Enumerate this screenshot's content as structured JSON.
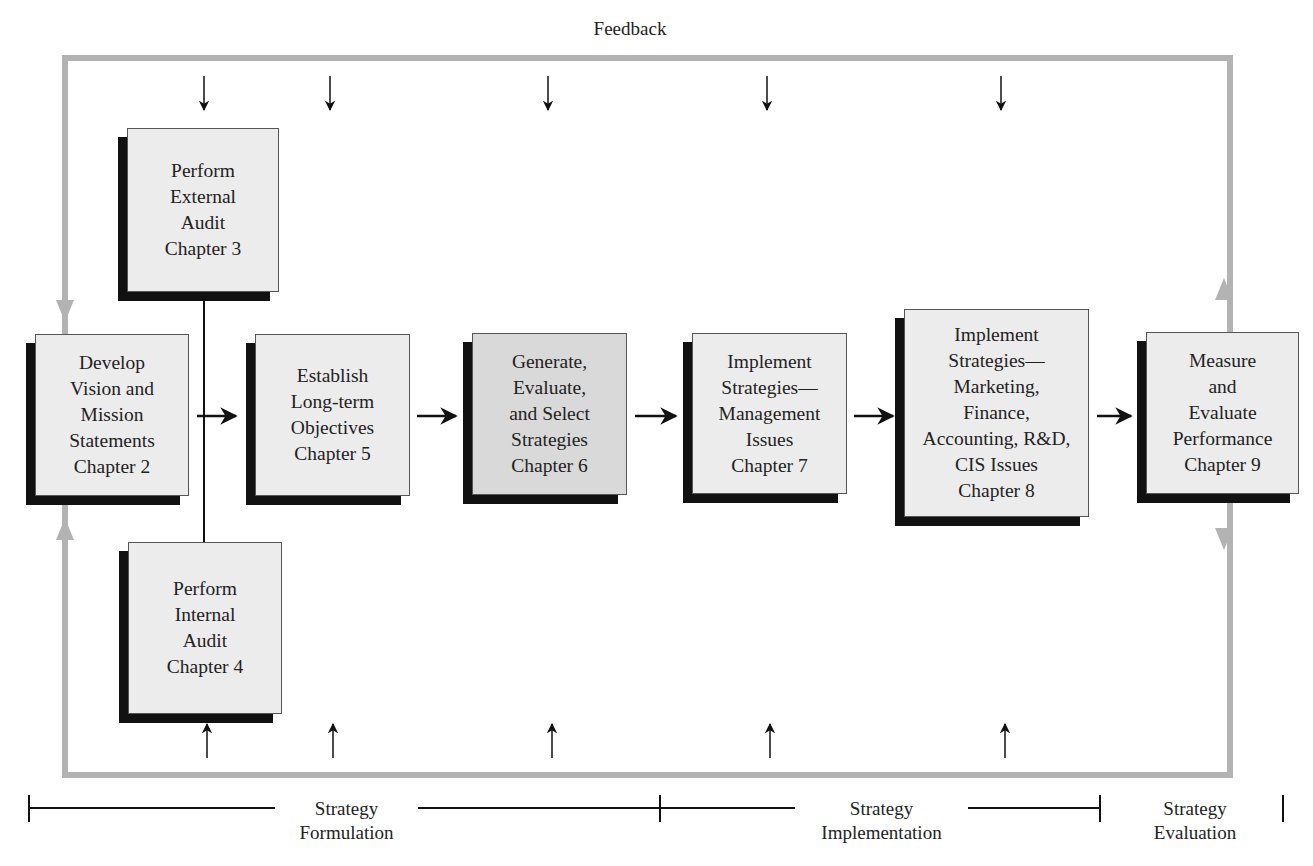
{
  "diagram": {
    "feedback_label": "Feedback",
    "colors": {
      "box_fill": "#ececec",
      "box_fill_highlight": "#d9d9d9",
      "shadow": "#111111",
      "feedback_loop": "#b3b3b3",
      "arrow": "#111111"
    },
    "boxes": {
      "external_audit": {
        "text": "Perform\nExternal\nAudit\nChapter 3"
      },
      "internal_audit": {
        "text": "Perform\nInternal\nAudit\nChapter 4"
      },
      "vision_mission": {
        "text": "Develop\nVision and\nMission\nStatements\nChapter 2"
      },
      "long_term_objectives": {
        "text": "Establish\nLong-term\nObjectives\nChapter 5"
      },
      "generate_strategies": {
        "text": "Generate,\nEvaluate,\nand Select\nStrategies\nChapter 6"
      },
      "implement_management": {
        "text": "Implement\nStrategies—\nManagement\nIssues\nChapter 7"
      },
      "implement_functional": {
        "text": "Implement\nStrategies—\nMarketing,\nFinance,\nAccounting, R&D,\nCIS Issues\nChapter 8"
      },
      "measure_evaluate": {
        "text": "Measure\nand\nEvaluate\nPerformance\nChapter 9"
      }
    },
    "phases": {
      "formulation": "Strategy\nFormulation",
      "implementation": "Strategy\nImplementation",
      "evaluation": "Strategy\nEvaluation"
    }
  }
}
